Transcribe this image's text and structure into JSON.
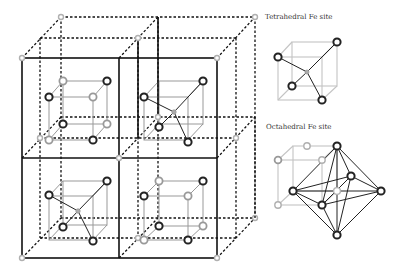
{
  "figure": {
    "labels": {
      "tetrahedral": "Tetrahedral Fe site",
      "octahedral": "Octahedral Fe site"
    },
    "legend_icons": {
      "oxygen": "dark-ring-icon",
      "iron": "gray-dot-icon"
    },
    "colors": {
      "line": "#111111",
      "oxygen_ring": "#222222",
      "fe_site": "#999999",
      "light_ring": "#b0b0b0"
    }
  }
}
